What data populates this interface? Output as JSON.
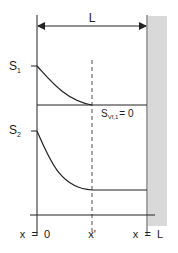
{
  "diagram": {
    "length_label": "L",
    "top_plot": {
      "start_label_main": "S",
      "start_label_sub": "1",
      "end_condition_main": "S",
      "end_condition_sub": "Vf,1",
      "end_condition_value": "= 0"
    },
    "bottom_plot": {
      "start_label_main": "S",
      "start_label_sub": "2"
    },
    "x_axis": {
      "tick_left": "x  =  0",
      "tick_mid": "x'",
      "tick_right": "x  =  L"
    },
    "colors": {
      "line": "#222222",
      "wall": "#d9d9d9"
    }
  }
}
